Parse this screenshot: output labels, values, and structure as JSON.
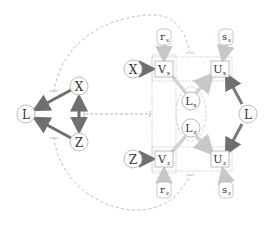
{
  "diagram": {
    "left_graph": {
      "nodes": [
        {
          "id": "X",
          "label": "X",
          "cx": 79,
          "cy": 86
        },
        {
          "id": "Z",
          "label": "Z",
          "cx": 79,
          "cy": 142
        },
        {
          "id": "L",
          "label": "L",
          "cx": 26,
          "cy": 114
        }
      ],
      "edges": [
        {
          "from": "X",
          "to": "L",
          "style": "thick-arrow"
        },
        {
          "from": "Z",
          "to": "L",
          "style": "thick-arrow"
        },
        {
          "from": "X",
          "to": "Z",
          "style": "bidirected-thick"
        }
      ]
    },
    "right_graph": {
      "circle_nodes": [
        {
          "id": "X2",
          "label": "X",
          "sub": "",
          "cx": 133,
          "cy": 69
        },
        {
          "id": "Z2",
          "label": "Z",
          "sub": "",
          "cx": 133,
          "cy": 159
        },
        {
          "id": "L2",
          "label": "L",
          "sub": "",
          "cx": 248,
          "cy": 114
        },
        {
          "id": "Lx",
          "label": "L",
          "sub": "x",
          "cx": 191,
          "cy": 101
        },
        {
          "id": "Lz",
          "label": "L",
          "sub": "z",
          "cx": 191,
          "cy": 128
        }
      ],
      "box_nodes": [
        {
          "id": "Vx",
          "label": "V",
          "sub": "x",
          "cx": 164,
          "cy": 69
        },
        {
          "id": "Ux",
          "label": "U",
          "sub": "x",
          "cx": 220,
          "cy": 69
        },
        {
          "id": "Vz",
          "label": "V",
          "sub": "z",
          "cx": 164,
          "cy": 159
        },
        {
          "id": "Uz",
          "label": "U",
          "sub": "z",
          "cx": 220,
          "cy": 159
        }
      ],
      "rounded_nodes": [
        {
          "id": "rx",
          "label": "r",
          "sub": "x",
          "cx": 164,
          "cy": 37
        },
        {
          "id": "sx",
          "label": "s",
          "sub": "x",
          "cx": 226,
          "cy": 37
        },
        {
          "id": "rz",
          "label": "r",
          "sub": "z",
          "cx": 164,
          "cy": 190
        },
        {
          "id": "sz",
          "label": "s",
          "sub": "z",
          "cx": 226,
          "cy": 190
        }
      ]
    },
    "colors": {
      "node_stroke": "#bbbbbb",
      "dark_arrow": "#777777",
      "light_arrow": "#cccccc",
      "dashed": "#aaaaaa",
      "text": "#333333"
    }
  }
}
